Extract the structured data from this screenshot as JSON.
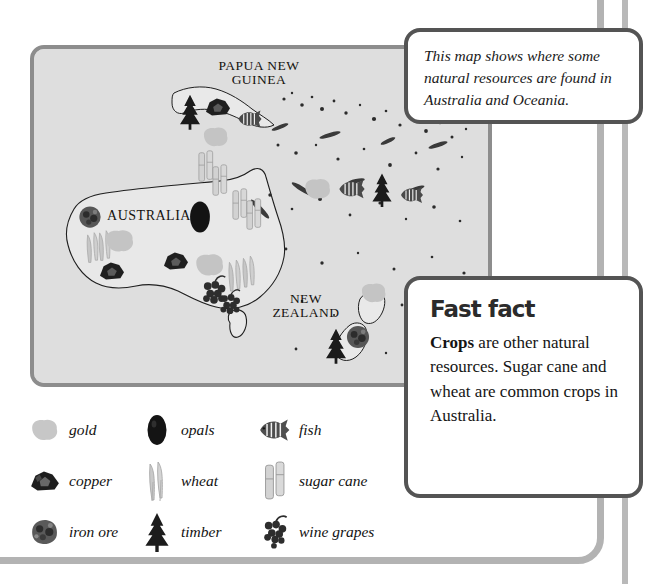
{
  "map": {
    "panel_label": "resource-map-australia-oceania",
    "background_color": "#dedede",
    "border_color": "#8d8d8d",
    "labels": {
      "papua_new_guinea": "PAPUA NEW\nGUINEA",
      "australia": "AUSTRALIA",
      "new_zealand": "NEW\nZEALAND"
    },
    "markers": [
      {
        "resource": "timber",
        "region": "Papua New Guinea"
      },
      {
        "resource": "copper",
        "region": "Papua New Guinea"
      },
      {
        "resource": "fish",
        "region": "Papua New Guinea"
      },
      {
        "resource": "gold",
        "region": "Papua New Guinea"
      },
      {
        "resource": "sugar-cane",
        "region": "Queensland coast"
      },
      {
        "resource": "sugar-cane",
        "region": "Eastern Australia"
      },
      {
        "resource": "iron-ore",
        "region": "Western Australia"
      },
      {
        "resource": "wheat",
        "region": "Western Australia"
      },
      {
        "resource": "gold",
        "region": "Western Australia"
      },
      {
        "resource": "copper",
        "region": "Western Australia"
      },
      {
        "resource": "copper",
        "region": "South Australia"
      },
      {
        "resource": "gold",
        "region": "South Australia"
      },
      {
        "resource": "opals",
        "region": "Central Australia"
      },
      {
        "resource": "wine-grapes",
        "region": "South-east Australia"
      },
      {
        "resource": "wheat",
        "region": "South-east Australia"
      },
      {
        "resource": "iron-ore",
        "region": "New Zealand"
      },
      {
        "resource": "timber",
        "region": "New Zealand"
      },
      {
        "resource": "gold",
        "region": "New Zealand"
      },
      {
        "resource": "fish",
        "region": "Pacific Islands"
      },
      {
        "resource": "fish",
        "region": "Pacific Islands"
      },
      {
        "resource": "timber",
        "region": "Pacific Islands"
      },
      {
        "resource": "gold",
        "region": "Pacific Islands"
      }
    ]
  },
  "callout": {
    "text": "This map shows where some natural resources are found in Australia and Oceania."
  },
  "fast_fact": {
    "title": "Fast fact",
    "lead": "Crops",
    "body": " are other natural resources. Sugar cane and wheat are common crops in Australia."
  },
  "legend": {
    "items": [
      {
        "label": "gold",
        "icon": "gold-nugget-icon"
      },
      {
        "label": "opals",
        "icon": "opal-stone-icon"
      },
      {
        "label": "fish",
        "icon": "fish-icon"
      },
      {
        "label": "copper",
        "icon": "copper-rock-icon"
      },
      {
        "label": "wheat",
        "icon": "wheat-stalks-icon"
      },
      {
        "label": "sugar cane",
        "icon": "sugar-cane-icon"
      },
      {
        "label": "iron ore",
        "icon": "iron-ore-rock-icon"
      },
      {
        "label": "timber",
        "icon": "pine-tree-icon"
      },
      {
        "label": "wine grapes",
        "icon": "grape-cluster-icon"
      }
    ]
  },
  "colors": {
    "map_fill": "#dedede",
    "map_border": "#8d8d8d",
    "callout_border": "#545454",
    "page_frame": "#b3b3b3",
    "gold": "#c9c9c9",
    "opal": "#141414",
    "copper": "#2a2a2a",
    "iron_ore": "#555555",
    "sugar_cane": "#d5d5d5",
    "wheat": "#c2c2c2"
  }
}
